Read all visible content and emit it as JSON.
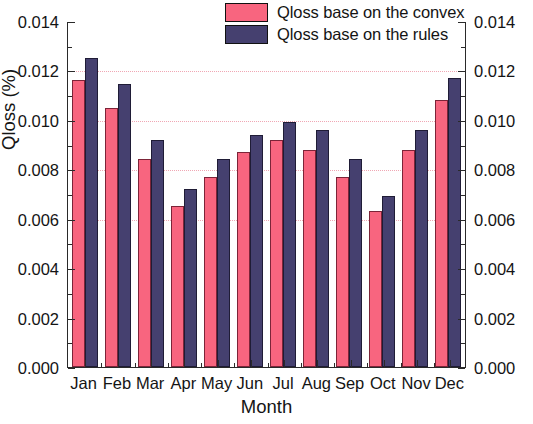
{
  "chart_data": {
    "type": "bar",
    "title": "",
    "xlabel": "Month",
    "ylabel": "Qloss (%)",
    "categories": [
      "Jan",
      "Feb",
      "Mar",
      "Apr",
      "May",
      "Jun",
      "Jul",
      "Aug",
      "Sep",
      "Oct",
      "Nov",
      "Dec"
    ],
    "series": [
      {
        "name": "Qloss base on the convex",
        "color": "#f8657f",
        "values": [
          0.0116,
          0.0105,
          0.0084,
          0.0065,
          0.0077,
          0.0087,
          0.0092,
          0.0088,
          0.0077,
          0.0063,
          0.0088,
          0.0108
        ]
      },
      {
        "name": "Qloss base on the rules",
        "color": "#45406f",
        "values": [
          0.0125,
          0.01145,
          0.0092,
          0.0072,
          0.0084,
          0.0094,
          0.0099,
          0.0096,
          0.0084,
          0.0069,
          0.0096,
          0.0117
        ]
      }
    ],
    "ylim": [
      0.0,
      0.014
    ],
    "ytick_labels": [
      "0.000",
      "0.002",
      "0.004",
      "0.006",
      "0.008",
      "0.010",
      "0.012",
      "0.014"
    ],
    "ytick_values": [
      0.0,
      0.002,
      0.004,
      0.006,
      0.008,
      0.01,
      0.012,
      0.014
    ],
    "ytick_labels_right": [
      "0.000",
      "0.002",
      "0.004",
      "0.006",
      "0.008",
      "0.010",
      "0.012",
      "0.014"
    ],
    "gridlines": [
      "0.006",
      "0.008",
      "0.010",
      "0.012"
    ],
    "grid": true,
    "grid_color": "#f0a7b4",
    "legend_position": "top-center",
    "axis_color": "#2a2a2a"
  },
  "legend": {
    "items": [
      {
        "label": "Qloss base on the convex",
        "color": "#f8657f"
      },
      {
        "label": "Qloss base on the rules",
        "color": "#45406f"
      }
    ]
  },
  "axes": {
    "y_title": "Qloss (%)",
    "x_title": "Month"
  }
}
